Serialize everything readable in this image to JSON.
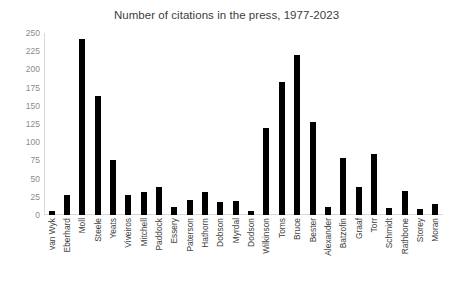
{
  "chart_data": {
    "type": "bar",
    "title": "Number of citations in the press, 1977-2023",
    "xlabel": "",
    "ylabel": "",
    "ylim": [
      0,
      250
    ],
    "yticks": [
      0,
      25,
      50,
      75,
      100,
      125,
      150,
      175,
      200,
      225,
      250
    ],
    "grid": false,
    "legend": false,
    "bar_color": "#000000",
    "axis_color": "#d9d9d9",
    "tick_label_color": "#8c8c8c",
    "category_label_color": "#404040",
    "categories": [
      "van Wyk",
      "Eberhard",
      "Moll",
      "Steele",
      "Yeats",
      "Viveiros",
      "Mitchell",
      "Paddock",
      "Essery",
      "Paterson",
      "Hathorn",
      "Dobson",
      "Myrdal",
      "Dodson",
      "Wilkinson",
      "Toms",
      "Bruce",
      "Bester",
      "Alexander",
      "Batzofin",
      "Graaf",
      "Torr",
      "Schmidt",
      "Rathbone",
      "Storey",
      "Moran"
    ],
    "values": [
      6,
      28,
      242,
      164,
      75,
      28,
      31,
      39,
      11,
      20,
      31,
      18,
      19,
      5,
      120,
      183,
      220,
      128,
      11,
      78,
      39,
      84,
      10,
      33,
      8,
      15
    ]
  }
}
